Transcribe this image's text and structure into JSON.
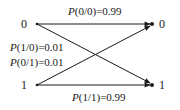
{
  "diagram": {
    "type": "binary-channel-transition",
    "inputs": [
      {
        "label": "0"
      },
      {
        "label": "1"
      }
    ],
    "outputs": [
      {
        "label": "0"
      },
      {
        "label": "1"
      }
    ],
    "edges": [
      {
        "from": "0",
        "to": "0",
        "prob_fn": "P",
        "cond": "(0/0)",
        "value": "=0.99"
      },
      {
        "from": "0",
        "to": "1",
        "prob_fn": "P",
        "cond": "(1/0)",
        "value": "=0.01"
      },
      {
        "from": "1",
        "to": "0",
        "prob_fn": "P",
        "cond": "(0/1)",
        "value": "=0.01"
      },
      {
        "from": "1",
        "to": "1",
        "prob_fn": "P",
        "cond": "(1/1)",
        "value": "=0.99"
      }
    ],
    "colors": {
      "ink": "#1a1a1a",
      "background": "#ffffff"
    }
  }
}
